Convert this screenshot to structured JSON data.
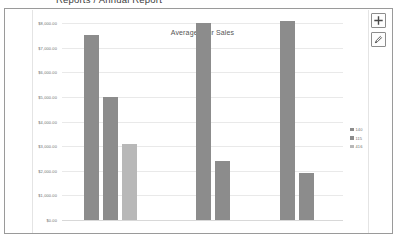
{
  "header": {
    "report_title": "Reports / Annual Report"
  },
  "controls": {
    "add_label": "+",
    "add_icon": "plus-icon",
    "edit_icon": "pencil-icon"
  },
  "colors": {
    "series_primary": "#8c8c8c",
    "series_secondary": "#8c8c8c",
    "series_tertiary": "#b8b8b8",
    "gridline": "#e9e9e9",
    "panel_border": "#9a9a9a",
    "axis_text": "#6e6e6e",
    "title_text": "#555555"
  },
  "chart_data": {
    "type": "bar",
    "title": "Average Tour Sales",
    "xlabel": "",
    "ylabel": "",
    "ylim": [
      0,
      8000
    ],
    "grid": true,
    "legend_position": "right",
    "yticks": [
      0,
      1000,
      2000,
      3000,
      4000,
      5000,
      6000,
      7000,
      8000
    ],
    "ytick_labels": [
      "$0.00",
      "$1,000.00",
      "$2,000.00",
      "$3,000.00",
      "$4,000.00",
      "$5,000.00",
      "$6,000.00",
      "$7,000.00",
      "$8,000.00"
    ],
    "categories": [
      "Group 1",
      "Group 2",
      "Group 3"
    ],
    "series": [
      {
        "name": "140",
        "color": "#8c8c8c",
        "values": [
          7500,
          8000,
          8100
        ]
      },
      {
        "name": "115",
        "color": "#8c8c8c",
        "values": [
          5000,
          2400,
          1900
        ]
      },
      {
        "name": "416",
        "color": "#b8b8b8",
        "values": [
          3100,
          null,
          null
        ]
      }
    ],
    "bars": [
      {
        "label": "140",
        "group": 0,
        "value": 7500,
        "color": "#8c8c8c"
      },
      {
        "label": "115",
        "group": 0,
        "value": 5000,
        "color": "#8c8c8c"
      },
      {
        "label": "416",
        "group": 0,
        "value": 3100,
        "color": "#b8b8b8"
      },
      {
        "label": "140",
        "group": 1,
        "value": 8000,
        "color": "#8c8c8c"
      },
      {
        "label": "115",
        "group": 1,
        "value": 2400,
        "color": "#8c8c8c"
      },
      {
        "label": "140",
        "group": 2,
        "value": 8100,
        "color": "#8c8c8c"
      },
      {
        "label": "115",
        "group": 2,
        "value": 1900,
        "color": "#8c8c8c"
      }
    ],
    "legend": [
      {
        "label": "140",
        "color": "#8c8c8c"
      },
      {
        "label": "115",
        "color": "#8c8c8c"
      },
      {
        "label": "416",
        "color": "#b8b8b8"
      }
    ]
  }
}
